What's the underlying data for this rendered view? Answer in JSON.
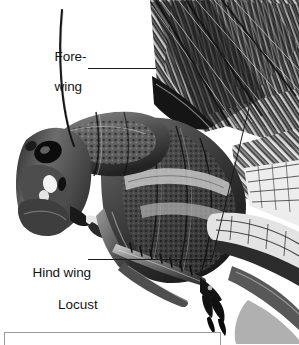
{
  "figure": {
    "kind": "labelled-photograph",
    "subject": "locust",
    "background_color": "#ffffff",
    "ink_color": "#1b1b1b",
    "width": 299,
    "height": 344
  },
  "labels": [
    {
      "id": "forewing",
      "name": "forewing-label",
      "line1": "Fore-",
      "line2": "wing",
      "x": 40,
      "y": 34,
      "leader": {
        "x": 88,
        "y": 68,
        "length": 68
      }
    },
    {
      "id": "hindwing",
      "name": "hind-wing-label",
      "line1": "Hind wing",
      "line2": "",
      "x": 18,
      "y": 250,
      "leader": {
        "x": 88,
        "y": 259,
        "length": 124
      }
    }
  ],
  "caption": {
    "text": "Locust",
    "x": 58,
    "y": 297
  },
  "pointer_line": {
    "name": "hind-wing-pointer",
    "from_x": 212,
    "from_y": 259,
    "to_x": 249,
    "to_y": 108
  },
  "bottom_box": {
    "name": "caption-panel-top-edge",
    "x": 4,
    "y": 332,
    "width": 215,
    "height": 12,
    "border_color": "#9a9a9a"
  },
  "photo": {
    "name": "locust-photograph",
    "alt": "Black and white photograph of a locust in left profile showing head, antenna, pronotum, thorax, folded forewing and hind wing, and legs",
    "tone_dark": "#111111",
    "tone_mid": "#5a5a5a",
    "tone_light": "#d8d8d8"
  }
}
